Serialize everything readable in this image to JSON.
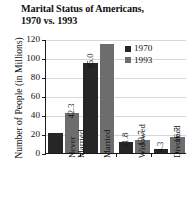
{
  "chart_data": {
    "type": "bar",
    "title": "Marital Status of Americans,\n1970 vs. 1993",
    "xlabel": "",
    "ylabel": "Number of People (in Millions)",
    "ylim": [
      0,
      120
    ],
    "yticks": [
      0,
      20,
      40,
      60,
      80,
      100,
      120
    ],
    "ytick_labels": [
      "0",
      "20",
      "40",
      "60",
      "80",
      "100",
      "120"
    ],
    "grid": true,
    "legend_position": "upper right",
    "categories": [
      "Never\nMarried",
      "Married",
      "Widowed",
      "Divorced"
    ],
    "series": [
      {
        "name": "1970",
        "color": "#262626",
        "values": [
          21.0,
          95.0,
          11.8,
          4.3
        ],
        "labels": [
          "",
          "95.0",
          "11.8",
          "4.3"
        ]
      },
      {
        "name": "1993",
        "color": "#6d6d6d",
        "values": [
          42.3,
          115.0,
          13.7,
          16.7
        ],
        "labels": [
          "42.3",
          "",
          "13.7",
          "16.7"
        ]
      }
    ]
  },
  "legend": {
    "entries": [
      {
        "label": "1970",
        "color": "#262626"
      },
      {
        "label": "1993",
        "color": "#6d6d6d"
      }
    ]
  }
}
